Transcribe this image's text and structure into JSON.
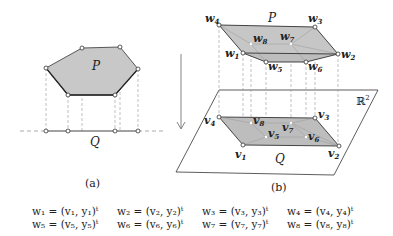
{
  "panel_a": {
    "caption": "(a)",
    "polygon_label": "P",
    "line_label": "Q",
    "polygon_fill": "#c8c8c8",
    "polygon_vertices": [
      [
        46,
        68
      ],
      [
        82,
        48
      ],
      [
        120,
        47
      ],
      [
        138,
        69
      ],
      [
        115,
        95
      ],
      [
        68,
        95
      ]
    ]
  },
  "panel_b": {
    "caption": "(b)",
    "upper_label": "P",
    "lower_label": "Q",
    "plane_label": "ℝ",
    "plane_label_sup": "2",
    "upper_vertex_labels": {
      "w1": "w",
      "w2": "w",
      "w3": "w",
      "w4": "w",
      "w5": "w",
      "w6": "w",
      "w7": "w",
      "w8": "w"
    },
    "w_subscripts": [
      "1",
      "2",
      "3",
      "4",
      "5",
      "6",
      "7",
      "8"
    ],
    "v_subscripts": [
      "1",
      "2",
      "3",
      "4",
      "5",
      "6",
      "7",
      "8"
    ],
    "vertex_letter_w": "w",
    "vertex_letter_v": "v"
  },
  "equations": {
    "row1": [
      "w₁ = (v₁, y₁)ᵗ",
      "w₂ = (v₂, y₂)ᵗ",
      "w₃ = (v₃, y₃)ᵗ",
      "w₄ = (v₄, y₄)ᵗ"
    ],
    "row2": [
      "w₅ = (v₅, y₅)ᵗ",
      "w₆ = (v₆, y₆)ᵗ",
      "w₇ = (v₇, y₇)ᵗ",
      "w₈ = (v₈, y₈)ᵗ"
    ]
  }
}
